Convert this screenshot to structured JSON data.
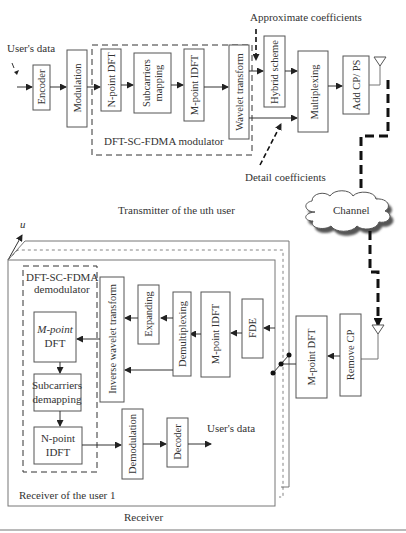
{
  "transmitter": {
    "input_label": "User's data",
    "blocks": {
      "encoder": "Encoder",
      "modulation": "Modulation",
      "n_point_dft": "N-point DFT",
      "subcarriers_mapping_1": "Subcarriers",
      "subcarriers_mapping_2": "mapping",
      "m_point_idft": "M-point IDFT",
      "wavelet_transform": "Wavelet transform",
      "hybrid_scheme": "Hybrid scheme",
      "multiplexing": "Multiplexing",
      "add_cp_ps": "Add CP/ PS"
    },
    "modulator_label": "DFT-SC-FDMA modulator",
    "approx_coeff_label": "Approximate coefficients",
    "detail_coeff_label": "Detail coefficients",
    "caption": "Transmitter of the uth user"
  },
  "channel": {
    "label": "Channel"
  },
  "receiver": {
    "user_index_label": "u",
    "demodulator_label_1": "DFT-SC-FDMA",
    "demodulator_label_2": "demodulator",
    "blocks": {
      "remove_cp": "Remove CP",
      "m_point_dft_outer": "M-point DFT",
      "fde": "FDE",
      "m_point_idft": "M-point IDFT",
      "demultiplexing": "Demultiplexing",
      "expanding": "Expanding",
      "inverse_wavelet_transform": "Inverse wavelet transform",
      "m_point_dft_1": "M-point",
      "m_point_dft_2": "DFT",
      "subcarriers_demapping_1": "Subcarriers",
      "subcarriers_demapping_2": "demapping",
      "n_point_idft_1": "N-point",
      "n_point_idft_2": "IDFT",
      "demodulation": "Demodulation",
      "decoder": "Decoder"
    },
    "output_label": "User's data",
    "user1_label": "Receiver of the user 1",
    "caption": "Receiver"
  }
}
